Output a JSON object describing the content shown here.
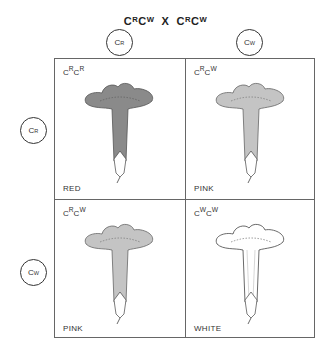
{
  "title": {
    "left": "C",
    "left_sup1": "R",
    "left_mid": "C",
    "left_sup2": "W",
    "cross": "X",
    "right": "C",
    "right_sup1": "R",
    "right_mid": "C",
    "right_sup2": "W",
    "text": "CRCW X CRCW"
  },
  "column_alleles": [
    {
      "base": "C",
      "sup": "R"
    },
    {
      "base": "C",
      "sup": "W"
    }
  ],
  "row_alleles": [
    {
      "base": "C",
      "sup": "R"
    },
    {
      "base": "C",
      "sup": "W"
    }
  ],
  "cells": [
    {
      "genotype": {
        "a": "C",
        "a_sup": "R",
        "b": "C",
        "b_sup": "R"
      },
      "phenotype": "RED",
      "color": "#8a8a8a"
    },
    {
      "genotype": {
        "a": "C",
        "a_sup": "R",
        "b": "C",
        "b_sup": "W"
      },
      "phenotype": "PINK",
      "color": "#c4c4c4"
    },
    {
      "genotype": {
        "a": "C",
        "a_sup": "R",
        "b": "C",
        "b_sup": "W"
      },
      "phenotype": "PINK",
      "color": "#c4c4c4"
    },
    {
      "genotype": {
        "a": "C",
        "a_sup": "W",
        "b": "C",
        "b_sup": "W"
      },
      "phenotype": "WHITE",
      "color": "#ffffff"
    }
  ]
}
